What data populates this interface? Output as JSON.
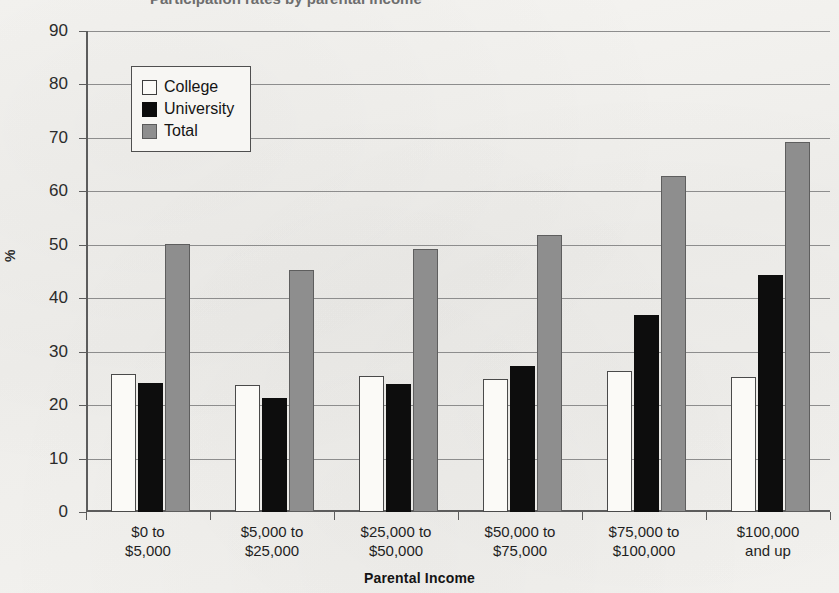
{
  "figure": {
    "cropped_title_fragment": "Participation rates by parental income",
    "axis_y_title": "%",
    "axis_x_title": "Parental Income"
  },
  "legend": {
    "position": "inside-top-left",
    "items": [
      {
        "label": "College",
        "swatch": "college",
        "color": "#ffffff"
      },
      {
        "label": "University",
        "swatch": "university",
        "color": "#000000"
      },
      {
        "label": "Total",
        "swatch": "total",
        "color": "#8e8e8e"
      }
    ]
  },
  "chart_data": {
    "type": "bar",
    "title": "",
    "xlabel": "Parental Income",
    "ylabel": "%",
    "ylim": [
      0,
      90
    ],
    "ytick_step": 10,
    "yticks": [
      0,
      10,
      20,
      30,
      40,
      50,
      60,
      70,
      80,
      90
    ],
    "grid": true,
    "legend_position": "inside-top-left",
    "categories": [
      "$0 to\n$5,000",
      "$5,000 to\n$25,000",
      "$25,000 to\n$50,000",
      "$50,000 to\n$75,000",
      "$75,000 to\n$100,000",
      "$100,000\nand up"
    ],
    "category_lines": [
      [
        "$0 to",
        "$5,000"
      ],
      [
        "$5,000 to",
        "$25,000"
      ],
      [
        "$25,000 to",
        "$50,000"
      ],
      [
        "$50,000 to",
        "$75,000"
      ],
      [
        "$75,000 to",
        "$100,000"
      ],
      [
        "$100,000",
        "and up"
      ]
    ],
    "series": [
      {
        "name": "College",
        "color": "#ffffff",
        "values": [
          25.8,
          23.7,
          25.4,
          24.9,
          26.3,
          25.3
        ]
      },
      {
        "name": "University",
        "color": "#000000",
        "values": [
          24.1,
          21.3,
          23.9,
          27.3,
          36.9,
          44.4
        ]
      },
      {
        "name": "Total",
        "color": "#8e8e8e",
        "values": [
          50.1,
          45.2,
          49.3,
          51.9,
          62.9,
          69.3
        ]
      }
    ]
  }
}
